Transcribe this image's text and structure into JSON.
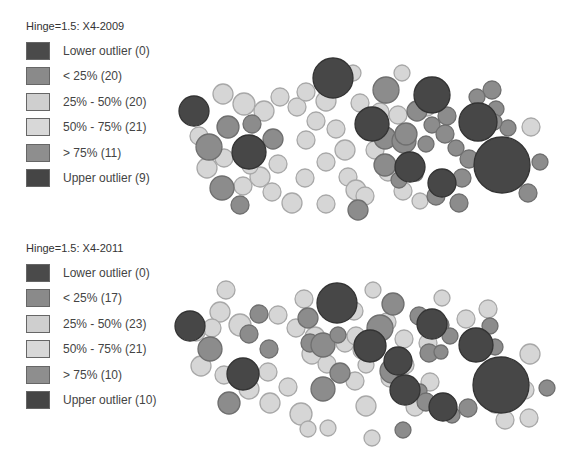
{
  "colors": {
    "lower_outlier": "#4a4a4a",
    "lt25": "#8a8a8a",
    "p25_50": "#cfcfcf",
    "p50_75": "#d8d8d8",
    "gt75": "#8e8e8e",
    "upper_outlier": "#454545"
  },
  "maps": [
    {
      "title": "Hinge=1.5: X4-2009",
      "legend": [
        {
          "label": "Lower outlier (0)",
          "class": "lower_outlier"
        },
        {
          "label": "< 25% (20)",
          "class": "lt25"
        },
        {
          "label": "25% - 50% (20)",
          "class": "p25_50"
        },
        {
          "label": "50% - 75% (21)",
          "class": "p50_75"
        },
        {
          "label": "> 75% (11)",
          "class": "gt75"
        },
        {
          "label": "Upper outlier (9)",
          "class": "upper_outlier"
        }
      ]
    },
    {
      "title": "Hinge=1.5: X4-2011",
      "legend": [
        {
          "label": "Lower outlier (0)",
          "class": "lower_outlier"
        },
        {
          "label": "< 25% (17)",
          "class": "lt25"
        },
        {
          "label": "25% - 50% (23)",
          "class": "p25_50"
        },
        {
          "label": "50% - 75% (21)",
          "class": "p50_75"
        },
        {
          "label": "> 75% (10)",
          "class": "gt75"
        },
        {
          "label": "Upper outlier (10)",
          "class": "upper_outlier"
        }
      ]
    }
  ]
}
